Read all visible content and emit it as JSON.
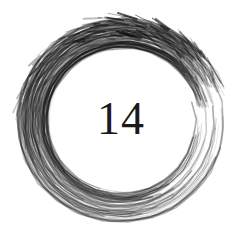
{
  "artwork": {
    "number": "14",
    "stroke_color": "#111111",
    "background": "#ffffff"
  }
}
